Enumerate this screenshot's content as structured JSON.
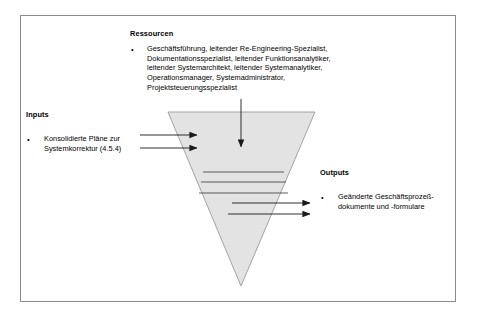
{
  "diagram": {
    "type": "funnel-process-diagram",
    "resources": {
      "heading": "Ressourcen",
      "bullet_marker": "•",
      "lines": [
        "Geschäftsführung, leitender Re-Engineering-Spezialist,",
        "Dokumentationsspezialist, leitender Funktionsanalytiker,",
        "leitender Systemarchitekt, leitender Systemanalytiker,",
        "Operationsmanager, Systemadministrator,",
        "Projektsteuerungsspezialist"
      ]
    },
    "inputs": {
      "heading": "Inputs",
      "bullet_marker": "•",
      "lines": [
        "Konsolidierte Pläne zur",
        "Systemkorrektur (4.5.4)"
      ]
    },
    "outputs": {
      "heading": "Outputs",
      "bullet_marker": "•",
      "lines": [
        "Geänderte Geschäftsprozeß-",
        "dokumente und -formulare"
      ]
    },
    "shape": {
      "name": "inverted-triangle-funnel",
      "fill_color": "#e3e3e3",
      "stroke_color": "#9a9a9a",
      "internal_line_count": 5
    },
    "arrows": {
      "input_arrow_count": 2,
      "resource_arrow_count": 1,
      "output_arrow_count": 2,
      "color": "#1a1a1a"
    },
    "frame": {
      "border_color": "#8a8a8a",
      "background_color": "#ffffff"
    }
  }
}
